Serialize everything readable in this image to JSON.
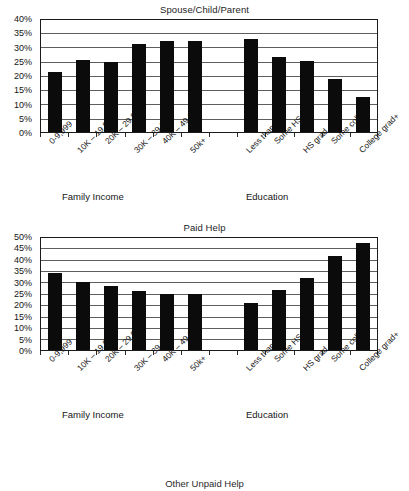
{
  "page": {
    "background": "#ffffff",
    "bar_color": "#0b0b0b",
    "axis_color": "#1b1b1b",
    "grid_color": "#5e5e5e"
  },
  "charts": [
    {
      "title": "Spouse/Child/Parent",
      "group_labels": {
        "income": "Family Income",
        "education": "Education"
      },
      "chart_data": {
        "type": "bar",
        "title": "Spouse/Child/Parent",
        "xlabel": "",
        "ylabel": "",
        "ylim": [
          0,
          40
        ],
        "ytick_labels": [
          "0%",
          "5%",
          "10%",
          "15%",
          "20%",
          "25%",
          "30%",
          "35%",
          "40%"
        ],
        "yticks": [
          0,
          5,
          10,
          15,
          20,
          25,
          30,
          35,
          40
        ],
        "grid": true,
        "legend": "none",
        "categories": [
          "0-9,999",
          "10K – 19,999",
          "20K – 29,999",
          "30K – 39,999",
          "40K – 49,999",
          "50k+",
          "",
          "Less than HS",
          "Some HS",
          "HS grad",
          "Some college",
          "College grad+"
        ],
        "values": [
          21.5,
          25.8,
          25.2,
          31.5,
          32.5,
          32.5,
          null,
          33.5,
          27.0,
          25.3,
          19.0,
          12.5
        ]
      }
    },
    {
      "title": "Paid Help",
      "group_labels": {
        "income": "Family Income",
        "education": "Education"
      },
      "chart_data": {
        "type": "bar",
        "title": "Paid Help",
        "xlabel": "",
        "ylabel": "",
        "ylim": [
          0,
          50
        ],
        "ytick_labels": [
          "0%",
          "5%",
          "10%",
          "15%",
          "20%",
          "25%",
          "30%",
          "35%",
          "40%",
          "45%",
          "50%"
        ],
        "yticks": [
          0,
          5,
          10,
          15,
          20,
          25,
          30,
          35,
          40,
          45,
          50
        ],
        "grid": true,
        "legend": "none",
        "categories": [
          "0-9,999",
          "10K – 19,999",
          "20K – 29,999",
          "30K – 39,999",
          "40K – 49,999",
          "50k+",
          "",
          "Less than HS",
          "Some HS",
          "HS grad",
          "Some college",
          "College grad+"
        ],
        "values": [
          34.3,
          30.5,
          28.7,
          26.5,
          25.0,
          25.0,
          null,
          21.0,
          27.0,
          32.2,
          42.2,
          47.8
        ]
      }
    }
  ],
  "cut_off_chart": {
    "title": "Other Unpaid Help"
  }
}
